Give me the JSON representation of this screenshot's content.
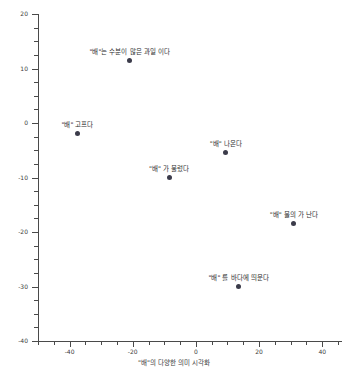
{
  "chart_data": {
    "type": "scatter",
    "title": "",
    "caption": "\"배\"의 다양한 의미 시각화",
    "xlabel": "",
    "ylabel": "",
    "xlim": [
      -50,
      45
    ],
    "ylim": [
      -40,
      20
    ],
    "grid": false,
    "legend": "none",
    "marker_color": "#3b3b4a",
    "axis_color": "#4a4a4a",
    "xticks": [
      -40,
      -20,
      0,
      20,
      40,
      60,
      80
    ],
    "xtick_labels": [
      "-40",
      "-20",
      "0",
      "20",
      "40",
      "60",
      "80"
    ],
    "yticks": [
      20,
      10,
      0,
      -10,
      -20,
      -30,
      -40
    ],
    "ytick_labels": [
      "20",
      "10",
      "0",
      "-10",
      "-20",
      "-30",
      "-40"
    ],
    "points": [
      {
        "label": "\"배\"는 수분이 많은 과일 이다",
        "x": -21.0,
        "y": 11.5
      },
      {
        "label": "\"배\" 고프다",
        "x": -37.5,
        "y": -2.0
      },
      {
        "label": "\"배\" 나온다",
        "x": 9.5,
        "y": -5.5
      },
      {
        "label": "\"배\" 가 불렀다",
        "x": -8.5,
        "y": -10.0
      },
      {
        "label": "\"배\" 물의 가 난다",
        "x": 31.0,
        "y": -18.5
      },
      {
        "label": "\"배\" 를 바다에 띄운다",
        "x": 13.5,
        "y": -30.0
      }
    ]
  }
}
